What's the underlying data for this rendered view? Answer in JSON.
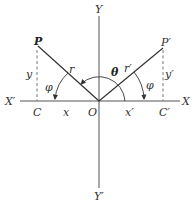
{
  "diagram": {
    "type": "coordinate-geometry",
    "labels": {
      "x_axis_pos": "X",
      "x_axis_neg": "X′",
      "y_axis_pos": "Y",
      "y_axis_neg": "Y′",
      "origin": "O",
      "point_p": "P",
      "point_p_prime": "P′",
      "foot_c": "C",
      "foot_c_prime": "C′",
      "r": "r",
      "r_prime": "r′",
      "x": "x",
      "x_prime": "x′",
      "y": "y",
      "y_prime": "y′",
      "phi_left": "φ",
      "phi_right": "φ",
      "theta": "θ"
    },
    "colors": {
      "line": "#333333",
      "axis": "#555555",
      "dash": "#666666",
      "background": "#ffffff"
    }
  }
}
